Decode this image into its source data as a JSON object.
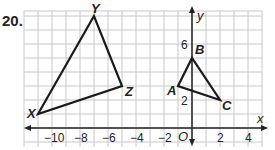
{
  "problem": {
    "number": "20."
  },
  "axes": {
    "x_label": "x",
    "y_label": "y",
    "origin_label": "O",
    "x_ticks": [
      "−10",
      "−8",
      "−6",
      "−4",
      "−2",
      "2",
      "4"
    ],
    "y_ticks": [
      "2",
      "6"
    ]
  },
  "chart_data": {
    "type": "scatter",
    "title": "",
    "xlabel": "x",
    "ylabel": "y",
    "xlim": [
      -12,
      5
    ],
    "ylim": [
      -1,
      8
    ],
    "grid": true,
    "series": [
      {
        "name": "Triangle XYZ",
        "points": [
          {
            "label": "X",
            "x": -11,
            "y": 1
          },
          {
            "label": "Y",
            "x": -7,
            "y": 8
          },
          {
            "label": "Z",
            "x": -5,
            "y": 3
          }
        ]
      },
      {
        "name": "Triangle ABC",
        "points": [
          {
            "label": "A",
            "x": -1,
            "y": 3
          },
          {
            "label": "B",
            "x": 0,
            "y": 5
          },
          {
            "label": "C",
            "x": 2,
            "y": 2
          }
        ]
      }
    ]
  },
  "vertices": {
    "X": "X",
    "Y": "Y",
    "Z": "Z",
    "A": "A",
    "B": "B",
    "C": "C"
  }
}
